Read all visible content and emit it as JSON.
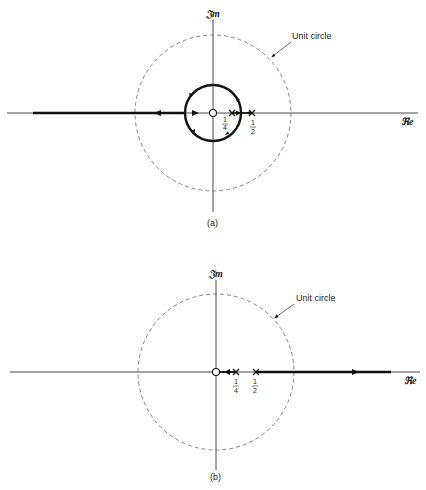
{
  "figures": [
    {
      "id": "a",
      "caption": "(a)",
      "axes": {
        "imag_label": "𝔍m",
        "real_label": "ℜe"
      },
      "unit_circle_label": "Unit circle",
      "markers": {
        "zero": "0",
        "poles": [
          "1/4",
          "1/2"
        ]
      },
      "tick_labels": {
        "quarter_num": "1",
        "quarter_den": "4",
        "half_num": "1",
        "half_den": "2"
      },
      "locus": "circle around origin plus negative real axis branch"
    },
    {
      "id": "b",
      "caption": "(b)",
      "axes": {
        "imag_label": "𝔍m",
        "real_label": "ℜe"
      },
      "unit_circle_label": "Unit circle",
      "markers": {
        "zero": "0",
        "poles": [
          "1/4",
          "1/2"
        ]
      },
      "tick_labels": {
        "quarter_num": "1",
        "quarter_den": "4",
        "half_num": "1",
        "half_den": "2"
      },
      "locus": "pole at 1/4 to zero at origin; pole at 1/2 to +infinity"
    }
  ]
}
